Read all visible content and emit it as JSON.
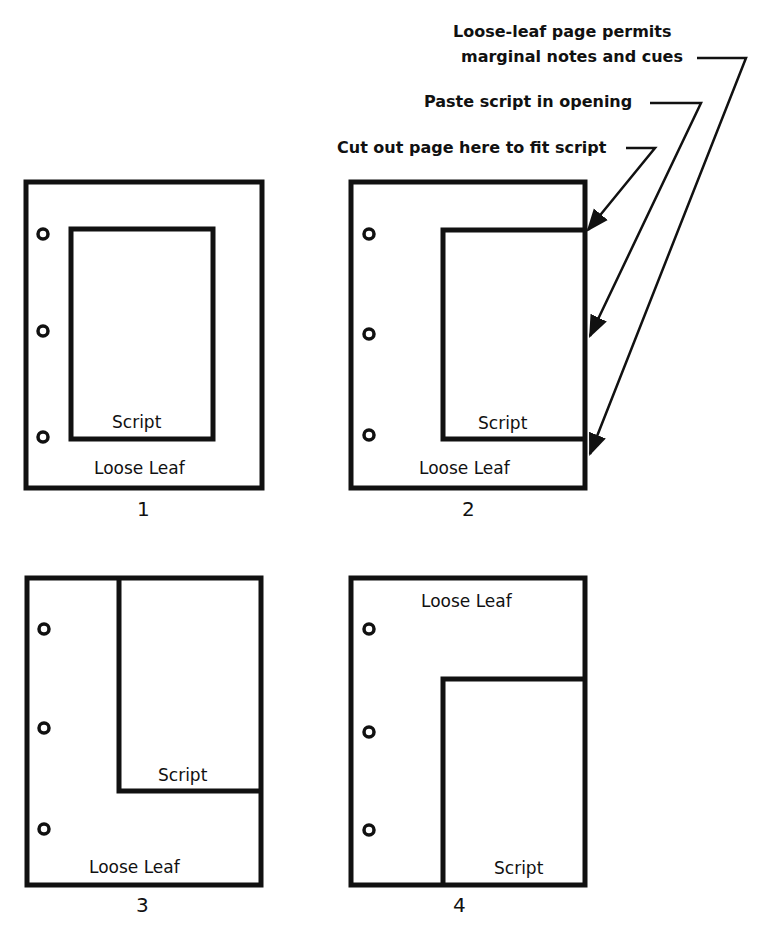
{
  "annotations": {
    "note_marginal_line1": "Loose-leaf page permits",
    "note_marginal_line2": "marginal notes and cues",
    "note_paste": "Paste script in opening",
    "note_cut": "Cut out page here to fit script"
  },
  "panels": [
    {
      "number": "1",
      "script_label": "Script",
      "leaf_label": "Loose Leaf"
    },
    {
      "number": "2",
      "script_label": "Script",
      "leaf_label": "Loose Leaf"
    },
    {
      "number": "3",
      "script_label": "Script",
      "leaf_label": "Loose Leaf"
    },
    {
      "number": "4",
      "script_label": "Script",
      "leaf_label": "Loose Leaf"
    }
  ],
  "colors": {
    "ink": "#111111",
    "paper": "#ffffff"
  }
}
